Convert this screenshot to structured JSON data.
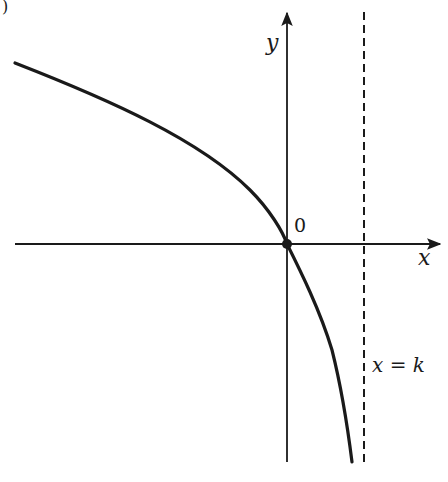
{
  "figure": {
    "corner_fragment": ")",
    "axes": {
      "x_label": "x",
      "y_label": "y",
      "origin_label": "0"
    },
    "asymptote": {
      "label": "x = k",
      "style": "dashed"
    },
    "curve": {
      "description": "Decreasing concave-down curve passing through the origin, approaching vertical asymptote x = k from the left as y goes to negative infinity"
    },
    "colors": {
      "ink": "#1a1a1a",
      "background": "#ffffff"
    }
  }
}
